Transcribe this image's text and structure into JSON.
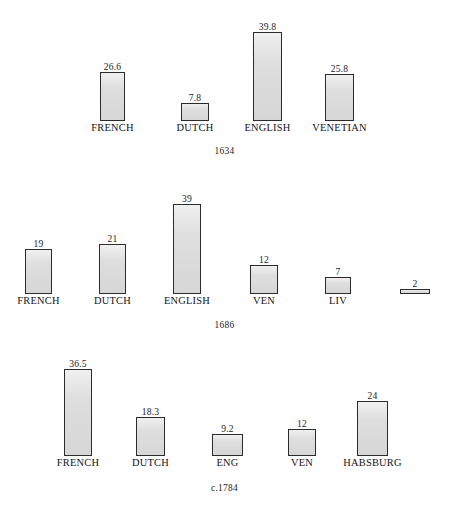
{
  "chart_data": [
    {
      "type": "bar",
      "title": "1634",
      "caption": "1634",
      "xlabel": "",
      "ylabel": "",
      "grid": false,
      "legend": "none",
      "ylim": [
        0,
        40
      ],
      "categories": [
        "FRENCH",
        "DUTCH",
        "ENGLISH",
        "VENETIAN"
      ],
      "values": [
        26.6,
        7.8,
        39.8,
        25.8
      ],
      "value_labels": [
        "26.6",
        "7.8",
        "39.8",
        "25.8"
      ],
      "bars": [
        {
          "label": "FRENCH",
          "value": 26.6,
          "value_label": "26.6",
          "x": 100,
          "width": 25,
          "height": 49
        },
        {
          "label": "DUTCH",
          "value": 7.8,
          "value_label": "7.8",
          "x": 181,
          "width": 28,
          "height": 18
        },
        {
          "label": "ENGLISH",
          "value": 39.8,
          "value_label": "39.8",
          "x": 253,
          "width": 29,
          "height": 89
        },
        {
          "label": "VENETIAN",
          "value": 25.8,
          "value_label": "25.8",
          "x": 325,
          "width": 29,
          "height": 47
        }
      ]
    },
    {
      "type": "bar",
      "title": "1686",
      "caption": "1686",
      "xlabel": "",
      "ylabel": "",
      "grid": false,
      "legend": "none",
      "ylim": [
        0,
        40
      ],
      "categories": [
        "FRENCH",
        "DUTCH",
        "ENGLISH",
        "VEN",
        "LIV",
        ""
      ],
      "values": [
        19,
        21,
        39,
        12,
        7,
        2
      ],
      "value_labels": [
        "19",
        "21",
        "39",
        "12",
        "7",
        "2"
      ],
      "bars": [
        {
          "label": "FRENCH",
          "value": 19,
          "value_label": "19",
          "x": 25,
          "width": 27,
          "height": 45
        },
        {
          "label": "DUTCH",
          "value": 21,
          "value_label": "21",
          "x": 99,
          "width": 27,
          "height": 50
        },
        {
          "label": "ENGLISH",
          "value": 39,
          "value_label": "39",
          "x": 173,
          "width": 28,
          "height": 90
        },
        {
          "label": "VEN",
          "value": 12,
          "value_label": "12",
          "x": 250,
          "width": 28,
          "height": 29
        },
        {
          "label": "LIV",
          "value": 7,
          "value_label": "7",
          "x": 325,
          "width": 26,
          "height": 17
        },
        {
          "label": "",
          "value": 2,
          "value_label": "2",
          "x": 400,
          "width": 30,
          "height": 5
        }
      ]
    },
    {
      "type": "bar",
      "title": "c.1784",
      "caption": "c.1784",
      "xlabel": "",
      "ylabel": "",
      "grid": false,
      "legend": "none",
      "ylim": [
        0,
        40
      ],
      "categories": [
        "FRENCH",
        "DUTCH",
        "ENG",
        "VEN",
        "HABSBURG"
      ],
      "values": [
        36.5,
        18.3,
        9.2,
        12,
        24
      ],
      "value_labels": [
        "36.5",
        "18.3",
        "9.2",
        "12",
        "24"
      ],
      "bars": [
        {
          "label": "FRENCH",
          "value": 36.5,
          "value_label": "36.5",
          "x": 64,
          "width": 28,
          "height": 87
        },
        {
          "label": "DUTCH",
          "value": 18.3,
          "value_label": "18.3",
          "x": 136,
          "width": 29,
          "height": 39
        },
        {
          "label": "ENG",
          "value": 9.2,
          "value_label": "9.2",
          "x": 212,
          "width": 31,
          "height": 22
        },
        {
          "label": "VEN",
          "value": 12,
          "value_label": "12",
          "x": 288,
          "width": 28,
          "height": 27
        },
        {
          "label": "HABSBURG",
          "value": 24,
          "value_label": "24",
          "x": 357,
          "width": 31,
          "height": 55
        }
      ]
    }
  ],
  "panels": [
    {
      "caption": "1634",
      "baseline_top": 121,
      "caption_top": 146
    },
    {
      "caption": "1686",
      "baseline_top": 294,
      "caption_top": 320
    },
    {
      "caption": "c.1784",
      "baseline_top": 456,
      "caption_top": 483
    }
  ],
  "colors": {
    "bar_fill": "#dedede",
    "bar_stroke": "#2b2b2b",
    "text": "#141414",
    "background": "#ffffff"
  }
}
